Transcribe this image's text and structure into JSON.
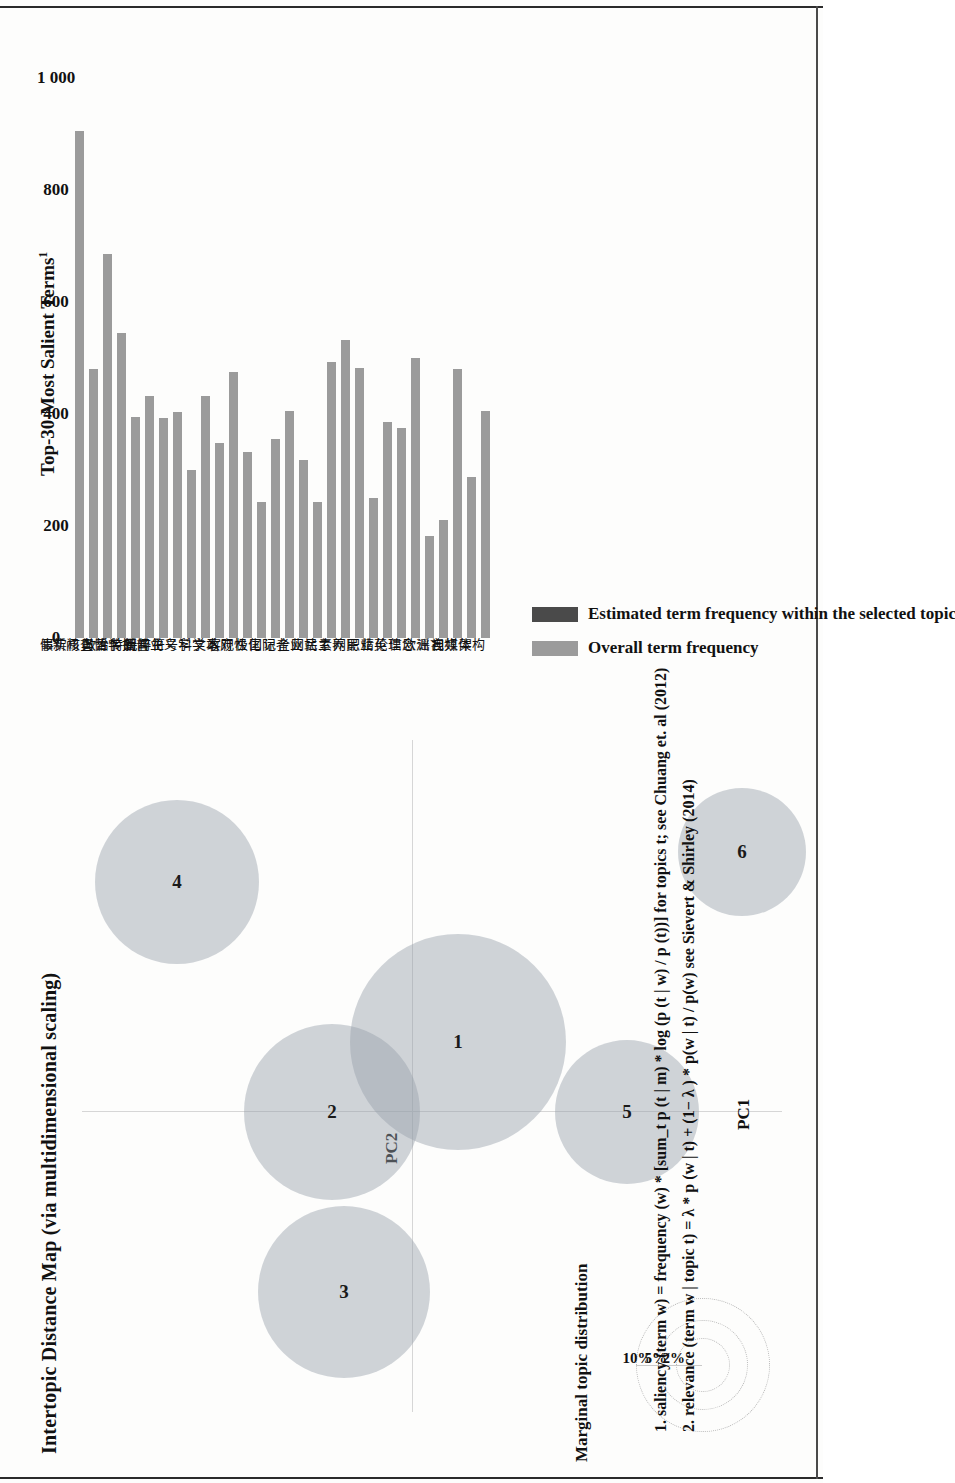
{
  "figure": {
    "left_panel_title": "Intertopic Distance Map (via multidimensional scaling)",
    "axis_x_label": "PC1",
    "axis_y_label": "PC2",
    "marginal_legend_title": "Marginal topic distribution",
    "marginal_legend_ticks": [
      "2%",
      "5%",
      "10%"
    ],
    "right_panel_title": "Top-30 Most Salient Terms",
    "right_panel_title_sup": "1"
  },
  "legend": {
    "items": [
      {
        "label": "Overall term frequency",
        "color": "#9b9b9b"
      },
      {
        "label": "Estimated term frequency within the selected topic",
        "color": "#4a4a4a"
      }
    ]
  },
  "footnotes": [
    "1. saliency (term w) = frequency (w) * [sum_t p (t | m) * log (p (t | w) / p (t))] for topics t; see Chuang et. al (2012)",
    "2. relevance (term w | topic t) = λ * p (w | t) + (1− λ ) * p(w | t) / p(w) see Sievert & Shirley (2014)"
  ],
  "chart_data": {
    "type": "bar",
    "title": "Top-30 Most Salient Terms",
    "xlabel": "",
    "ylabel": "",
    "xlim": [
      0,
      1000
    ],
    "xticks": [
      0,
      200,
      400,
      600,
      800,
      1000
    ],
    "xtick_labels": [
      "0",
      "200",
      "400",
      "600",
      "800",
      "1 000"
    ],
    "grid": false,
    "legend_position": "below",
    "orientation": "vertical",
    "categories": [
      "假新闻",
      "事实核查",
      "舆情",
      "哲学",
      "政治传播",
      "特朗普",
      "新闻业",
      "民粹主义",
      "符号学",
      "科学",
      "文本",
      "政府",
      "客观性",
      "极化",
      "国际",
      "记者",
      "企业",
      "网站",
      "民主",
      "素养",
      "网民",
      "职业",
      "精英",
      "伦理",
      "信念",
      "欧洲",
      "谣言",
      "视频",
      "自媒体",
      "架构"
    ],
    "values": [
      905,
      480,
      685,
      545,
      395,
      432,
      393,
      403,
      300,
      432,
      348,
      475,
      333,
      242,
      355,
      405,
      318,
      242,
      492,
      532,
      483,
      250,
      385,
      375,
      500,
      183,
      210,
      480,
      288,
      405
    ],
    "series": [
      {
        "name": "Overall term frequency",
        "color": "#9b9b9b",
        "values": [
          905,
          480,
          685,
          545,
          395,
          432,
          393,
          403,
          300,
          432,
          348,
          475,
          333,
          242,
          355,
          405,
          318,
          242,
          492,
          532,
          483,
          250,
          385,
          375,
          500,
          183,
          210,
          480,
          288,
          405
        ]
      }
    ]
  },
  "topics": [
    {
      "id": "1",
      "cx": 370,
      "cy": 376,
      "r": 108
    },
    {
      "id": "2",
      "cx": 300,
      "cy": 250,
      "r": 88
    },
    {
      "id": "3",
      "cx": 120,
      "cy": 262,
      "r": 86
    },
    {
      "id": "4",
      "cx": 530,
      "cy": 95,
      "r": 82
    },
    {
      "id": "5",
      "cx": 300,
      "cy": 545,
      "r": 72
    },
    {
      "id": "6",
      "cx": 560,
      "cy": 660,
      "r": 64
    }
  ]
}
